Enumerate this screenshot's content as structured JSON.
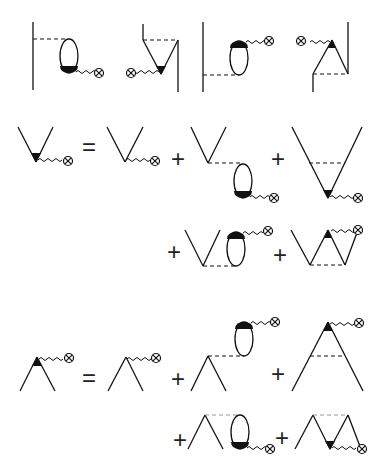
{
  "operators": {
    "eq1": "=",
    "plus1a": "+",
    "plus1b": "+",
    "plus1c": "+",
    "plus1d": "+",
    "eq2": "=",
    "plus2a": "+",
    "plus2b": "+",
    "plus2c": "+",
    "plus2d": "+"
  },
  "icons": {
    "source": "circled-x",
    "vertex": "filled-triangle",
    "loop": "ellipse-bubble"
  },
  "colors": {
    "line": "#111111",
    "background": "#ffffff"
  }
}
